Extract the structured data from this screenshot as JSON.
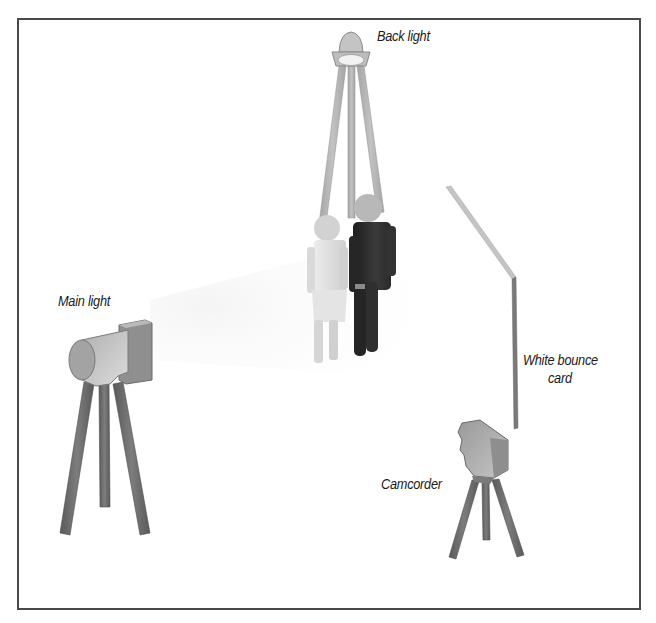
{
  "diagram": {
    "type": "lighting-setup",
    "labels": {
      "back_light": "Back light",
      "main_light": "Main light",
      "bounce_card_line1": "White bounce",
      "bounce_card_line2": "card",
      "camcorder": "Camcorder"
    },
    "elements": [
      {
        "id": "back-light",
        "kind": "light-on-tripod",
        "label": "Back light"
      },
      {
        "id": "main-light",
        "kind": "light-on-tripod",
        "label": "Main light"
      },
      {
        "id": "subjects",
        "kind": "two-people"
      },
      {
        "id": "bounce-card",
        "kind": "reflector",
        "label": "White bounce card"
      },
      {
        "id": "camcorder",
        "kind": "camera-on-tripod",
        "label": "Camcorder"
      }
    ],
    "colors": {
      "border": "#4a4a4a",
      "tripod_dark": "#6e6e6e",
      "tripod_light": "#b3b3b3",
      "person_light": "#d4d4d4",
      "person_dark": "#2e2e2e",
      "lamp_body": "#c8c8c8",
      "beam": "#f4f4f4"
    }
  }
}
